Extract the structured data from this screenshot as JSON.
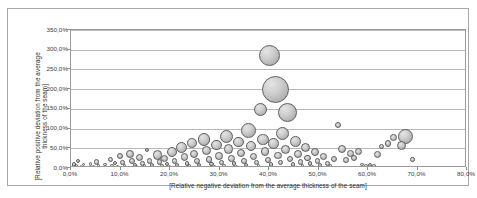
{
  "chart_data": {
    "type": "scatter",
    "subtype": "bubble",
    "title": "",
    "xlabel": "[Relative negative deviation from the average thickness  of the seam]",
    "ylabel": "[Relative positive deviation from the average thickness  of the seam]",
    "xlim": [
      0,
      80
    ],
    "ylim": [
      0,
      350
    ],
    "x_tick_labels": [
      "0,0%",
      "10,0%",
      "20,0%",
      "30,0%",
      "40,0%",
      "50,0%",
      "60,0%",
      "70,0%",
      "80,0%"
    ],
    "x_tick_values": [
      0,
      10,
      20,
      30,
      40,
      50,
      60,
      70,
      80
    ],
    "y_tick_labels": [
      "0,0%",
      "50,0%",
      "100,0%",
      "150,0%",
      "200,0%",
      "250,0%",
      "300,0%",
      "350,0%"
    ],
    "y_tick_values": [
      0,
      50,
      100,
      150,
      200,
      250,
      300,
      350
    ],
    "grid": "horizontal",
    "legend": "none",
    "bubble_fill": "#c9c9c9",
    "bubble_stroke": "#5d5d5d",
    "gridline_color": "#b9b9b9",
    "axis_color": "#9a9a9a",
    "points": [
      {
        "x": 0.6,
        "y": 9,
        "r": 2.4
      },
      {
        "x": 0.8,
        "y": 3,
        "r": 2.0
      },
      {
        "x": 1.4,
        "y": 17,
        "r": 2.0
      },
      {
        "x": 1.1,
        "y": 5,
        "r": 1.6
      },
      {
        "x": 2.0,
        "y": 4,
        "r": 1.4
      },
      {
        "x": 2.6,
        "y": 8,
        "r": 1.6
      },
      {
        "x": 3.2,
        "y": 3,
        "r": 1.3
      },
      {
        "x": 3.9,
        "y": 10,
        "r": 1.8
      },
      {
        "x": 4.5,
        "y": 4,
        "r": 1.4
      },
      {
        "x": 5.1,
        "y": 15,
        "r": 2.6
      },
      {
        "x": 5.6,
        "y": 5,
        "r": 1.6
      },
      {
        "x": 6.2,
        "y": 2,
        "r": 1.2
      },
      {
        "x": 6.9,
        "y": 9,
        "r": 1.9
      },
      {
        "x": 7.4,
        "y": 3,
        "r": 1.3
      },
      {
        "x": 7.9,
        "y": 22,
        "r": 2.6
      },
      {
        "x": 8.3,
        "y": 6,
        "r": 1.7
      },
      {
        "x": 8.9,
        "y": 12,
        "r": 2.1
      },
      {
        "x": 9.4,
        "y": 3,
        "r": 1.4
      },
      {
        "x": 9.9,
        "y": 30,
        "r": 3.2
      },
      {
        "x": 10.4,
        "y": 14,
        "r": 2.3
      },
      {
        "x": 10.8,
        "y": 6,
        "r": 1.8
      },
      {
        "x": 11.3,
        "y": 2,
        "r": 1.2
      },
      {
        "x": 11.9,
        "y": 36,
        "r": 4.3
      },
      {
        "x": 12.4,
        "y": 19,
        "r": 3.0
      },
      {
        "x": 12.9,
        "y": 8,
        "r": 2.0
      },
      {
        "x": 13.3,
        "y": 3,
        "r": 1.4
      },
      {
        "x": 13.9,
        "y": 27,
        "r": 3.6
      },
      {
        "x": 14.4,
        "y": 12,
        "r": 2.3
      },
      {
        "x": 14.9,
        "y": 5,
        "r": 1.6
      },
      {
        "x": 15.4,
        "y": 46,
        "r": 2.2
      },
      {
        "x": 15.9,
        "y": 18,
        "r": 2.8
      },
      {
        "x": 16.3,
        "y": 7,
        "r": 1.9
      },
      {
        "x": 16.9,
        "y": 2,
        "r": 1.2
      },
      {
        "x": 17.4,
        "y": 33,
        "r": 4.6
      },
      {
        "x": 17.9,
        "y": 15,
        "r": 2.6
      },
      {
        "x": 18.4,
        "y": 6,
        "r": 1.8
      },
      {
        "x": 18.9,
        "y": 24,
        "r": 3.4
      },
      {
        "x": 19.4,
        "y": 10,
        "r": 2.1
      },
      {
        "x": 19.9,
        "y": 4,
        "r": 1.5
      },
      {
        "x": 20.4,
        "y": 40,
        "r": 5.0
      },
      {
        "x": 20.9,
        "y": 17,
        "r": 2.8
      },
      {
        "x": 21.4,
        "y": 7,
        "r": 1.9
      },
      {
        "x": 21.9,
        "y": 2,
        "r": 1.2
      },
      {
        "x": 22.4,
        "y": 52,
        "r": 5.6
      },
      {
        "x": 22.9,
        "y": 28,
        "r": 3.8
      },
      {
        "x": 23.4,
        "y": 12,
        "r": 2.3
      },
      {
        "x": 23.9,
        "y": 5,
        "r": 1.6
      },
      {
        "x": 24.4,
        "y": 63,
        "r": 4.8
      },
      {
        "x": 24.9,
        "y": 36,
        "r": 4.2
      },
      {
        "x": 25.4,
        "y": 18,
        "r": 2.9
      },
      {
        "x": 25.9,
        "y": 8,
        "r": 2.0
      },
      {
        "x": 26.4,
        "y": 3,
        "r": 1.3
      },
      {
        "x": 26.9,
        "y": 72,
        "r": 6.2
      },
      {
        "x": 27.4,
        "y": 44,
        "r": 4.4
      },
      {
        "x": 27.9,
        "y": 22,
        "r": 3.2
      },
      {
        "x": 28.4,
        "y": 10,
        "r": 2.2
      },
      {
        "x": 28.9,
        "y": 4,
        "r": 1.5
      },
      {
        "x": 29.4,
        "y": 58,
        "r": 5.2
      },
      {
        "x": 29.9,
        "y": 31,
        "r": 3.8
      },
      {
        "x": 30.4,
        "y": 14,
        "r": 2.5
      },
      {
        "x": 30.9,
        "y": 6,
        "r": 1.7
      },
      {
        "x": 31.4,
        "y": 80,
        "r": 6.8
      },
      {
        "x": 31.9,
        "y": 48,
        "r": 4.6
      },
      {
        "x": 32.4,
        "y": 25,
        "r": 3.4
      },
      {
        "x": 32.9,
        "y": 11,
        "r": 2.3
      },
      {
        "x": 33.4,
        "y": 4,
        "r": 1.5
      },
      {
        "x": 33.9,
        "y": 66,
        "r": 5.4
      },
      {
        "x": 34.4,
        "y": 38,
        "r": 4.2
      },
      {
        "x": 34.9,
        "y": 18,
        "r": 2.9
      },
      {
        "x": 35.4,
        "y": 8,
        "r": 2.0
      },
      {
        "x": 35.9,
        "y": 96,
        "r": 7.4
      },
      {
        "x": 36.4,
        "y": 57,
        "r": 5.0
      },
      {
        "x": 36.9,
        "y": 29,
        "r": 3.6
      },
      {
        "x": 37.4,
        "y": 13,
        "r": 2.4
      },
      {
        "x": 37.9,
        "y": 5,
        "r": 1.6
      },
      {
        "x": 38.3,
        "y": 148,
        "r": 6.5
      },
      {
        "x": 38.8,
        "y": 73,
        "r": 5.6
      },
      {
        "x": 39.2,
        "y": 42,
        "r": 4.3
      },
      {
        "x": 39.7,
        "y": 20,
        "r": 3.0
      },
      {
        "x": 40.1,
        "y": 285,
        "r": 10.5
      },
      {
        "x": 40.4,
        "y": 9,
        "r": 2.1
      },
      {
        "x": 40.9,
        "y": 62,
        "r": 5.2
      },
      {
        "x": 41.3,
        "y": 200,
        "r": 13.5
      },
      {
        "x": 41.8,
        "y": 32,
        "r": 3.8
      },
      {
        "x": 42.3,
        "y": 14,
        "r": 2.5
      },
      {
        "x": 42.8,
        "y": 88,
        "r": 6.4
      },
      {
        "x": 43.3,
        "y": 46,
        "r": 4.4
      },
      {
        "x": 43.8,
        "y": 140,
        "r": 9.5
      },
      {
        "x": 44.3,
        "y": 22,
        "r": 3.1
      },
      {
        "x": 44.8,
        "y": 9,
        "r": 2.1
      },
      {
        "x": 45.3,
        "y": 68,
        "r": 5.4
      },
      {
        "x": 45.8,
        "y": 35,
        "r": 3.9
      },
      {
        "x": 46.3,
        "y": 15,
        "r": 2.6
      },
      {
        "x": 46.8,
        "y": 6,
        "r": 1.7
      },
      {
        "x": 47.3,
        "y": 52,
        "r": 4.6
      },
      {
        "x": 47.8,
        "y": 25,
        "r": 3.3
      },
      {
        "x": 48.3,
        "y": 11,
        "r": 2.2
      },
      {
        "x": 48.8,
        "y": 4,
        "r": 1.5
      },
      {
        "x": 49.3,
        "y": 40,
        "r": 4.0
      },
      {
        "x": 49.8,
        "y": 18,
        "r": 2.8
      },
      {
        "x": 50.3,
        "y": 8,
        "r": 1.9
      },
      {
        "x": 51.0,
        "y": 30,
        "r": 3.4
      },
      {
        "x": 51.8,
        "y": 12,
        "r": 2.3
      },
      {
        "x": 52.5,
        "y": 5,
        "r": 1.6
      },
      {
        "x": 53.2,
        "y": 22,
        "r": 3.0
      },
      {
        "x": 54.0,
        "y": 110,
        "r": 3.0
      },
      {
        "x": 54.8,
        "y": 48,
        "r": 4.0
      },
      {
        "x": 55.6,
        "y": 20,
        "r": 2.8
      },
      {
        "x": 56.4,
        "y": 36,
        "r": 3.4
      },
      {
        "x": 57.2,
        "y": 25,
        "r": 3.0
      },
      {
        "x": 58.0,
        "y": 42,
        "r": 3.6
      },
      {
        "x": 58.8,
        "y": 9,
        "r": 1.9
      },
      {
        "x": 59.6,
        "y": 5,
        "r": 1.6
      },
      {
        "x": 60.4,
        "y": 8,
        "r": 2.0
      },
      {
        "x": 61.2,
        "y": 6,
        "r": 1.8
      },
      {
        "x": 62.0,
        "y": 35,
        "r": 3.6
      },
      {
        "x": 62.8,
        "y": 55,
        "r": 2.6
      },
      {
        "x": 64.0,
        "y": 62,
        "r": 3.2
      },
      {
        "x": 65.2,
        "y": 78,
        "r": 3.4
      },
      {
        "x": 66.8,
        "y": 58,
        "r": 4.6
      },
      {
        "x": 67.6,
        "y": 80,
        "r": 7.6
      },
      {
        "x": 69.0,
        "y": 22,
        "r": 2.2
      }
    ]
  },
  "axis": {
    "y_title": "[Relative positive deviation from the average thickness  of the seam]",
    "x_title": "[Relative negative deviation from the average thickness  of the seam]"
  }
}
